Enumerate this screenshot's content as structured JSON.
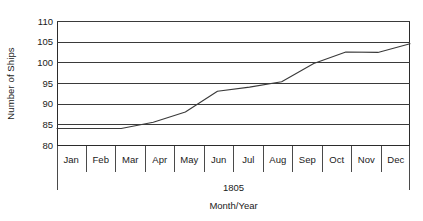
{
  "chart_data": {
    "type": "line",
    "title": "",
    "subtitle": "",
    "xlabel": "Month/Year",
    "ylabel": "Number of Ships",
    "year_label": "1805",
    "categories": [
      "Jan",
      "Feb",
      "Mar",
      "Apr",
      "May",
      "Jun",
      "Jul",
      "Aug",
      "Sep",
      "Oct",
      "Nov",
      "Dec"
    ],
    "series": [
      {
        "name": "Number of Ships",
        "values": [
          84,
          84,
          84,
          85.5,
          88,
          93,
          94,
          95.3,
          99.7,
          102.5,
          102.4,
          104.5
        ]
      }
    ],
    "ylim": [
      80,
      110
    ],
    "yticks": [
      80,
      85,
      90,
      95,
      100,
      105,
      110
    ],
    "ytick_labels": [
      "80",
      "85",
      "90",
      "95",
      "100",
      "105",
      "110"
    ],
    "grid": true,
    "grid_axis": "y",
    "legend": false,
    "legend_position": "none",
    "line_color": "#3a3a3a",
    "grid_color": "#3a3a3a",
    "axis_color": "#2b2b2b",
    "background": "#ffffff"
  }
}
